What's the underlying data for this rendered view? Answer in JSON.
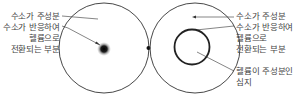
{
  "diagram": {
    "left_panel": {
      "labels": [
        {
          "id": "hydrogen_main",
          "text": "수소가 주성분"
        },
        {
          "id": "conversion_line1",
          "text": "수소가 반응하여"
        },
        {
          "id": "conversion_line2",
          "text": "헬륨으로"
        },
        {
          "id": "conversion_line3",
          "text": "전환되는 부분"
        }
      ]
    },
    "right_panel": {
      "labels": [
        {
          "id": "hydrogen_main",
          "text": "수소가 주성분"
        },
        {
          "id": "conversion_line1",
          "text": "수소가 반응하여"
        },
        {
          "id": "conversion_line2",
          "text": "헬륨으로"
        },
        {
          "id": "conversion_line3",
          "text": "전환되는 부분"
        },
        {
          "id": "helium_core_line1",
          "text": "헬륨이 주성분인"
        },
        {
          "id": "helium_core_line2",
          "text": "심지"
        }
      ]
    },
    "colors": {
      "stroke": "#333333",
      "text": "#444444",
      "core": "#111111"
    }
  }
}
